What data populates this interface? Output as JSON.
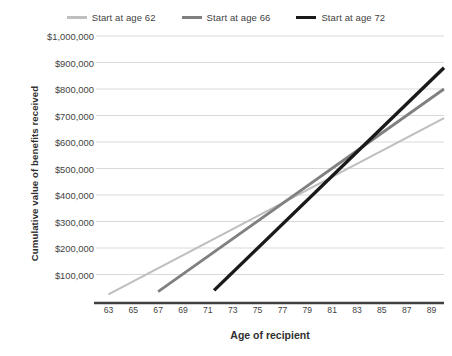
{
  "legend": {
    "position": "top-center",
    "entries": [
      {
        "label": "Start at age 62",
        "color": "#bfbfbf",
        "width": 2.2
      },
      {
        "label": "Start at age 66",
        "color": "#808080",
        "width": 2.8
      },
      {
        "label": "Start at age 72",
        "color": "#1a1a1a",
        "width": 3.4
      }
    ]
  },
  "axes": {
    "x_title": "Age of recipient",
    "y_title": "Cumulative value of benefits received"
  },
  "chart_data": {
    "type": "line",
    "title": "",
    "subtitle": "",
    "xlabel": "Age of recipient",
    "ylabel": "Cumulative value of benefits received",
    "xlim": [
      62,
      90
    ],
    "ylim": [
      0,
      1000000
    ],
    "grid": true,
    "grid_axis": "y",
    "legend_position": "top-center",
    "x_tick_labels": [
      "63",
      "65",
      "67",
      "69",
      "71",
      "73",
      "75",
      "77",
      "79",
      "81",
      "83",
      "85",
      "87",
      "89"
    ],
    "x_ticks": [
      63,
      65,
      67,
      69,
      71,
      73,
      75,
      77,
      79,
      81,
      83,
      85,
      87,
      89
    ],
    "y_tick_labels": [
      "$100,000",
      "$200,000",
      "$300,000",
      "$400,000",
      "$500,000",
      "$600,000",
      "$700,000",
      "$800,000",
      "$900,000",
      "$1,000,000"
    ],
    "y_ticks": [
      100000,
      200000,
      300000,
      400000,
      500000,
      600000,
      700000,
      800000,
      900000,
      1000000
    ],
    "series": [
      {
        "name": "Start at age 62",
        "color": "#bfbfbf",
        "line_width": 2.2,
        "x": [
          63,
          90
        ],
        "values": [
          25000,
          690000
        ],
        "points": [
          [
            63,
            25000
          ],
          [
            90,
            690000
          ]
        ]
      },
      {
        "name": "Start at age 66",
        "color": "#808080",
        "line_width": 2.8,
        "x": [
          67,
          90
        ],
        "values": [
          35000,
          800000
        ],
        "points": [
          [
            67,
            35000
          ],
          [
            90,
            800000
          ]
        ]
      },
      {
        "name": "Start at age 72",
        "color": "#1a1a1a",
        "line_width": 3.4,
        "x": [
          71.5,
          90
        ],
        "values": [
          40000,
          880000
        ],
        "points": [
          [
            71.5,
            40000
          ],
          [
            90,
            880000
          ]
        ]
      }
    ],
    "annotations": []
  },
  "style": {
    "background": "#ffffff",
    "grid_color": "#d9d9d9",
    "axis_color": "#404040",
    "text_color": "#3f3f3f"
  }
}
